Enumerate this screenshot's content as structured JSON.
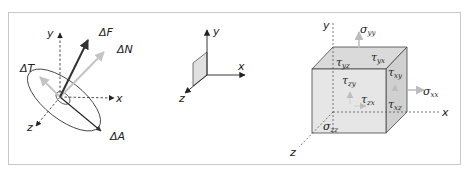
{
  "figure": {
    "frame_color": "#c8c8c8",
    "panels": [
      {
        "name": "surface-force-element",
        "labels": {
          "y": "y",
          "x": "x",
          "z": "z",
          "force": "ΔF",
          "normal": "ΔN",
          "tangential": "ΔT",
          "area": "ΔA"
        },
        "colors": {
          "force": "#333333",
          "normal": "#c8c8c8",
          "tangential": "#c8c8c8",
          "ellipse": "#444444"
        }
      },
      {
        "name": "plane-orientation",
        "labels": {
          "y": "y",
          "x": "x",
          "z": "z"
        },
        "colors": {
          "plane_fill": "#e0e0e0",
          "plane_stroke": "#555555"
        }
      },
      {
        "name": "stress-cube",
        "labels": {
          "y": "y",
          "x": "x",
          "z": "z",
          "sigma_yy": {
            "sym": "σ",
            "sub": "yy"
          },
          "sigma_xx": {
            "sym": "σ",
            "sub": "xx"
          },
          "sigma_zz": {
            "sym": "σ",
            "sub": "zz"
          },
          "tau_yz": {
            "sym": "τ",
            "sub": "yz"
          },
          "tau_yx": {
            "sym": "τ",
            "sub": "yx"
          },
          "tau_xy": {
            "sym": "τ",
            "sub": "xy"
          },
          "tau_zy": {
            "sym": "τ",
            "sub": "zy"
          },
          "tau_zx": {
            "sym": "τ",
            "sub": "zx"
          },
          "tau_xz": {
            "sym": "τ",
            "sub": "xz"
          }
        },
        "colors": {
          "front": "#e6e6e6",
          "top": "#d9d9d9",
          "side": "#cfcfcf",
          "edge": "#444444",
          "arrow": "#bdbdbd"
        }
      }
    ]
  }
}
